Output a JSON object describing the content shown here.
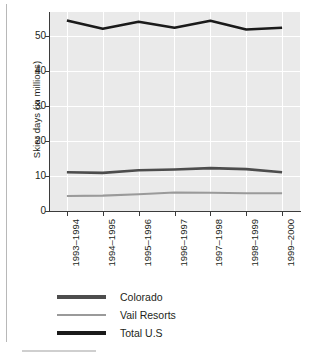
{
  "chart_data": {
    "type": "line",
    "title": "",
    "xlabel": "",
    "ylabel": "Skier days (in millions)",
    "categories": [
      "1993–1994",
      "1994–1995",
      "1995–1996",
      "1996–1997",
      "1997–1998",
      "1998–1999",
      "1999–2000"
    ],
    "ylim": [
      0,
      57
    ],
    "yticks": [
      0,
      10,
      20,
      30,
      40,
      50
    ],
    "ytick_labels": [
      "0",
      "10",
      "20",
      "30",
      "40",
      "50"
    ],
    "grid": true,
    "legend_position": "bottom-left",
    "series": [
      {
        "name": "Colorado",
        "color": "#4d4d4d",
        "values": [
          11.1,
          10.9,
          11.7,
          11.9,
          12.3,
          12.0,
          11.1
        ]
      },
      {
        "name": "Vail Resorts",
        "color": "#9a9a9a",
        "values": [
          4.3,
          4.4,
          4.8,
          5.3,
          5.2,
          5.1,
          5.1
        ]
      },
      {
        "name": "Total U.S",
        "color": "#1a1a1a",
        "values": [
          54.6,
          52.2,
          54.2,
          52.5,
          54.5,
          52.0,
          52.5
        ]
      }
    ]
  },
  "legend": {
    "items": [
      {
        "label": "Colorado"
      },
      {
        "label": "Vail Resorts"
      },
      {
        "label": "Total U.S"
      }
    ]
  },
  "colors": {
    "panel_background": "#eaeaea",
    "gridline": "#ffffff",
    "axis": "#3b3b3b",
    "text": "#231f20",
    "rule": "#b8b8b8"
  }
}
